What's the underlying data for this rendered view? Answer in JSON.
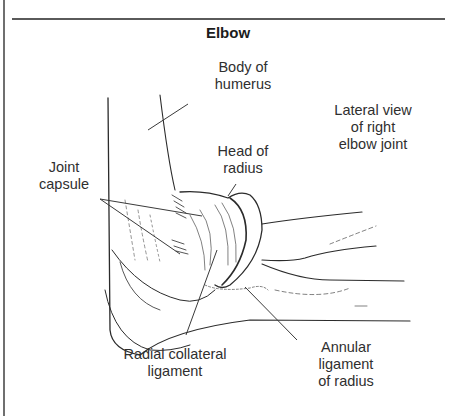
{
  "figure": {
    "title": "Elbow",
    "caption": "Lateral view of right elbow joint"
  },
  "labels": {
    "body_of_humerus": [
      "Body of",
      "humerus"
    ],
    "lateral_view": [
      "Lateral view",
      "of right",
      "elbow joint"
    ],
    "head_of_radius": [
      "Head of",
      "radius"
    ],
    "joint_capsule": [
      "Joint",
      "capsule"
    ],
    "radial_collateral_ligament": [
      "Radial collateral",
      "ligament"
    ],
    "annular_ligament": [
      "Annular",
      "ligament",
      "of radius"
    ]
  },
  "colors": {
    "line": "#2b2b2b",
    "border": "#6f6f6f",
    "background": "#ffffff"
  }
}
